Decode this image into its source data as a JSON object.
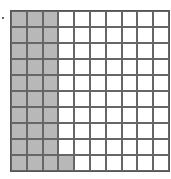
{
  "diagram": {
    "type": "hundred-grid",
    "rows": 10,
    "cols": 10,
    "shaded_count": 31,
    "shaded_description": "First 3 full columns shaded plus 1 cell in bottom row, column 4",
    "shaded_color": "#b8b8b8",
    "unshaded_color": "#ffffff",
    "line_color": "#666666",
    "marker": "bullet"
  }
}
